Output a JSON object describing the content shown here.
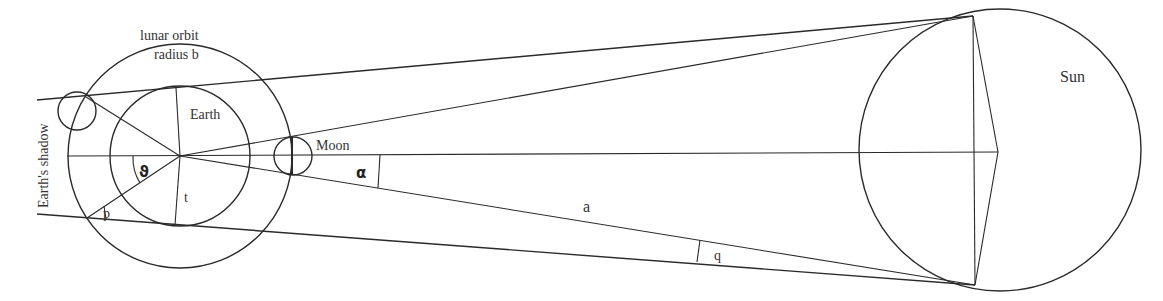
{
  "diagram": {
    "labels": {
      "lunar_orbit_line1": "lunar orbit",
      "lunar_orbit_line2": "radius b",
      "earth": "Earth",
      "earths_shadow": "Earth's shadow",
      "moon": "Moon",
      "sun": "Sun",
      "angle_theta": "ϑ",
      "angle_alpha": "α",
      "angle_p": "p",
      "angle_q": "q",
      "distance_a": "a",
      "radius_t": "t"
    },
    "bodies": [
      {
        "name": "Earth",
        "cx": 180,
        "cy": 156,
        "r": 70
      },
      {
        "name": "Lunar orbit",
        "cx": 180,
        "cy": 156,
        "r": 112
      },
      {
        "name": "Moon (in shadow)",
        "cx": 77,
        "cy": 110,
        "r": 19
      },
      {
        "name": "Moon",
        "cx": 294,
        "cy": 156,
        "r": 19
      },
      {
        "name": "Sun",
        "cx": 978,
        "cy": 150,
        "r": 141
      }
    ],
    "colors": {
      "stroke": "#2a2a2a",
      "text": "#333333",
      "background": "#ffffff"
    }
  }
}
